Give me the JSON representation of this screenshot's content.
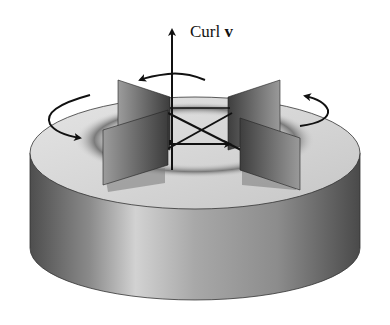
{
  "diagram": {
    "label": {
      "text": "Curl",
      "vector_symbol": "v"
    },
    "elements": [
      "cylinder-disk",
      "vortex-ring-on-top",
      "paddle-wheel-four-vanes",
      "curl-axis-arrow",
      "rotation-arrow-top",
      "rotation-arrow-bottom",
      "rotation-arrow-left",
      "rotation-arrow-right"
    ],
    "colors": {
      "background": "#ffffff",
      "disk_top": "#d8d8d8",
      "disk_side_dark": "#5a5a5a",
      "disk_side_light": "#c8c8c8",
      "vane_dark": "#3a3a3a",
      "vane_light": "#9a9a9a",
      "ink": "#111111"
    }
  }
}
